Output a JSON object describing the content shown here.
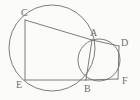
{
  "figure": {
    "background_color": "#fbfbfa",
    "stroke_color": "#6e6e6e",
    "label_color": "#6e6e6e",
    "stroke_width": 0.9,
    "width": 140,
    "height": 100
  },
  "labels": [
    {
      "id": "C",
      "text": "C",
      "x": 21,
      "y": 8
    },
    {
      "id": "A",
      "text": "A",
      "x": 90,
      "y": 28
    },
    {
      "id": "D",
      "text": "D",
      "x": 121,
      "y": 38
    },
    {
      "id": "E",
      "text": "E",
      "x": 16,
      "y": 80
    },
    {
      "id": "B",
      "text": "B",
      "x": 84,
      "y": 84
    },
    {
      "id": "F",
      "text": "F",
      "x": 122,
      "y": 76
    }
  ],
  "circles": [
    {
      "id": "large-circle",
      "cx": 52,
      "cy": 48,
      "r": 43
    },
    {
      "id": "small-circle",
      "cx": 99,
      "cy": 60,
      "r": 21
    }
  ],
  "points": {
    "C": {
      "x": 25,
      "y": 20
    },
    "A": {
      "x": 92,
      "y": 40
    },
    "D": {
      "x": 119,
      "y": 46
    },
    "E": {
      "x": 25,
      "y": 80
    },
    "B": {
      "x": 86,
      "y": 80
    },
    "F": {
      "x": 118,
      "y": 79
    }
  },
  "segments": [
    {
      "id": "segment-CE",
      "from": "C",
      "to": "E"
    },
    {
      "id": "segment-CA",
      "from": "C",
      "to": "A"
    },
    {
      "id": "segment-AD",
      "from": "A",
      "to": "D"
    },
    {
      "id": "segment-AB",
      "from": "A",
      "to": "B"
    },
    {
      "id": "segment-EB",
      "from": "E",
      "to": "B"
    },
    {
      "id": "segment-BF",
      "from": "B",
      "to": "F"
    },
    {
      "id": "segment-DF",
      "from": "D",
      "to": "F"
    }
  ]
}
